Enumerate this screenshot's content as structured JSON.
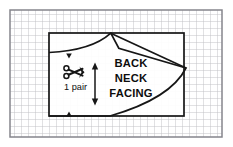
{
  "figure": {
    "kind": "sewing-pattern-layout-diagram",
    "background_color": "#ffffff",
    "ink_color": "#161616",
    "grid_color": "#b9b9bd",
    "frame": {
      "x": 10,
      "y": 10,
      "width": 212,
      "height": 127,
      "border_color": "#8a8a90"
    },
    "grid": {
      "cell_size": 7,
      "visible": true
    }
  },
  "fabric_block": {
    "name": "fabric-rectangle",
    "x": 49,
    "y": 33,
    "width": 135,
    "height": 83,
    "stroke_width": 1.6
  },
  "pattern_piece": {
    "label_lines": [
      "BACK",
      "NECK",
      "FACING"
    ],
    "label_x": 131,
    "label_y_start": 62,
    "label_line_height": 15,
    "notch_apex": {
      "x": 111,
      "y": 33
    },
    "notch_valley": {
      "x": 119,
      "y": 48
    },
    "right_point": {
      "x": 186,
      "y": 68
    },
    "left_edge_x": 49,
    "top_curve_start_y": 52,
    "bottom_curve_start": {
      "x": 110,
      "y": 116
    }
  },
  "quantity_marker": {
    "text": "1 pair",
    "x": 73,
    "y": 86,
    "scissors_icon": "scissors-icon",
    "scissors_x": 74,
    "scissors_y": 70
  },
  "grain_line": {
    "name": "grainline-double-arrow",
    "x": 95,
    "y_top": 63,
    "y_bottom": 105
  },
  "fold_notches": [
    {
      "name": "notch-top",
      "x": 69,
      "y": 53
    },
    {
      "name": "notch-bottom",
      "x": 69,
      "y": 116
    }
  ]
}
